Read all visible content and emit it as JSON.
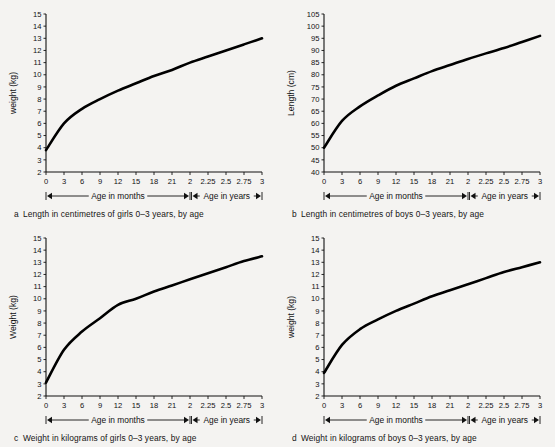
{
  "figure": {
    "background": "#f4f3f1",
    "line_color": "#000000",
    "panel_count": 4
  },
  "panels": [
    {
      "key": "a",
      "letter": "a",
      "caption": "Length in centimetres of girls 0–3 years, by age",
      "ylabel": "weight (kg)",
      "x_axis_label_months": "Age in months",
      "x_axis_label_years": "Age in years"
    },
    {
      "key": "b",
      "letter": "b",
      "caption": "Length in centimetres of boys 0–3 years, by age",
      "ylabel": "Length (cm)",
      "x_axis_label_months": "Age in months",
      "x_axis_label_years": "Age in years"
    },
    {
      "key": "c",
      "letter": "c",
      "caption": "Weight in kilograms of girls 0–3 years, by age",
      "ylabel": "Weight (kg)",
      "x_axis_label_months": "Age in months",
      "x_axis_label_years": "Age in years"
    },
    {
      "key": "d",
      "letter": "d",
      "caption": "Weight in kilograms of boys 0–3 years, by age",
      "ylabel": "weight (kg)",
      "x_axis_label_months": "Age in months",
      "x_axis_label_years": "Age in years"
    }
  ],
  "chart_data": [
    {
      "type": "line",
      "panel": "a",
      "title": "a  Length in centimetres of girls 0–3 years, by age",
      "xlabel": "Age in months / Age in years",
      "ylabel": "weight (kg)",
      "ylim": [
        2,
        15
      ],
      "yticks": [
        2,
        3,
        4,
        5,
        6,
        7,
        8,
        9,
        10,
        11,
        12,
        13,
        14,
        15
      ],
      "xtick_labels": [
        "0",
        "3",
        "6",
        "9",
        "12",
        "15",
        "18",
        "21",
        "2",
        "2.25",
        "2.5",
        "2.75",
        "3"
      ],
      "x_positions": [
        0,
        1,
        2,
        3,
        4,
        5,
        6,
        7,
        8,
        9,
        10,
        11,
        12
      ],
      "grid": false,
      "legend": "none",
      "series": [
        {
          "name": "girls weight",
          "x": [
            0,
            1,
            2,
            3,
            4,
            5,
            6,
            7,
            8,
            9,
            10,
            11,
            12
          ],
          "values": [
            3.8,
            6.0,
            7.2,
            8.0,
            8.7,
            9.3,
            9.9,
            10.4,
            11.0,
            11.5,
            12.0,
            12.5,
            13.0
          ]
        }
      ]
    },
    {
      "type": "line",
      "panel": "b",
      "title": "b  Length in centimetres of boys 0–3 years, by age",
      "xlabel": "Age in months / Age in years",
      "ylabel": "Length (cm)",
      "ylim": [
        40,
        105
      ],
      "yticks": [
        40,
        45,
        50,
        55,
        60,
        65,
        70,
        75,
        80,
        85,
        90,
        95,
        100,
        105
      ],
      "xtick_labels": [
        "0",
        "3",
        "6",
        "9",
        "12",
        "15",
        "18",
        "21",
        "2",
        "2.25",
        "2.5",
        "2.75",
        "3"
      ],
      "x_positions": [
        0,
        1,
        2,
        3,
        4,
        5,
        6,
        7,
        8,
        9,
        10,
        11,
        12
      ],
      "grid": false,
      "legend": "none",
      "series": [
        {
          "name": "boys length",
          "x": [
            0,
            1,
            2,
            3,
            4,
            5,
            6,
            7,
            8,
            9,
            10,
            11,
            12
          ],
          "values": [
            50,
            61,
            67,
            71.5,
            75.5,
            78.5,
            81.5,
            84.0,
            86.5,
            88.8,
            91.0,
            93.5,
            96.0
          ]
        }
      ]
    },
    {
      "type": "line",
      "panel": "c",
      "title": "c  Weight in kilograms of girls 0–3 years, by age",
      "xlabel": "Age in months / Age in years",
      "ylabel": "Weight (kg)",
      "ylim": [
        2,
        15
      ],
      "yticks": [
        2,
        3,
        4,
        5,
        6,
        7,
        8,
        9,
        10,
        11,
        12,
        13,
        14,
        15
      ],
      "xtick_labels": [
        "0",
        "3",
        "6",
        "9",
        "12",
        "15",
        "18",
        "21",
        "2",
        "2.25",
        "2.5",
        "2.75",
        "3"
      ],
      "x_positions": [
        0,
        1,
        2,
        3,
        4,
        5,
        6,
        7,
        8,
        9,
        10,
        11,
        12
      ],
      "grid": false,
      "legend": "none",
      "series": [
        {
          "name": "girls weight",
          "x": [
            0,
            1,
            2,
            3,
            4,
            5,
            6,
            7,
            8,
            9,
            10,
            11,
            12
          ],
          "values": [
            3.1,
            5.8,
            7.3,
            8.4,
            9.5,
            10.0,
            10.6,
            11.1,
            11.6,
            12.1,
            12.6,
            13.1,
            13.5
          ]
        }
      ]
    },
    {
      "type": "line",
      "panel": "d",
      "title": "d  Weight in kilograms of boys 0–3 years, by age",
      "xlabel": "Age in months / Age in years",
      "ylabel": "weight (kg)",
      "ylim": [
        2,
        15
      ],
      "yticks": [
        2,
        3,
        4,
        5,
        6,
        7,
        8,
        9,
        10,
        11,
        12,
        13,
        14,
        15
      ],
      "xtick_labels": [
        "0",
        "3",
        "6",
        "9",
        "12",
        "15",
        "18",
        "21",
        "2",
        "2.25",
        "2.5",
        "2.75",
        "3"
      ],
      "x_positions": [
        0,
        1,
        2,
        3,
        4,
        5,
        6,
        7,
        8,
        9,
        10,
        11,
        12
      ],
      "grid": false,
      "legend": "none",
      "series": [
        {
          "name": "boys weight",
          "x": [
            0,
            1,
            2,
            3,
            4,
            5,
            6,
            7,
            8,
            9,
            10,
            11,
            12
          ],
          "values": [
            3.9,
            6.2,
            7.5,
            8.3,
            9.0,
            9.6,
            10.2,
            10.7,
            11.2,
            11.7,
            12.2,
            12.6,
            13.0
          ]
        }
      ]
    }
  ]
}
